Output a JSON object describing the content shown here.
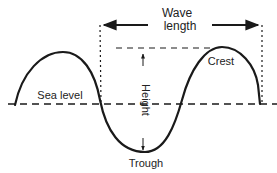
{
  "diagram": {
    "type": "wave-anatomy",
    "labels": {
      "wavelength_line1": "Wave",
      "wavelength_line2": "length",
      "crest": "Crest",
      "trough": "Trough",
      "sea_level": "Sea level",
      "height": "Height"
    },
    "colors": {
      "stroke": "#1a1a1a",
      "text": "#222222",
      "background": "#ffffff"
    }
  }
}
